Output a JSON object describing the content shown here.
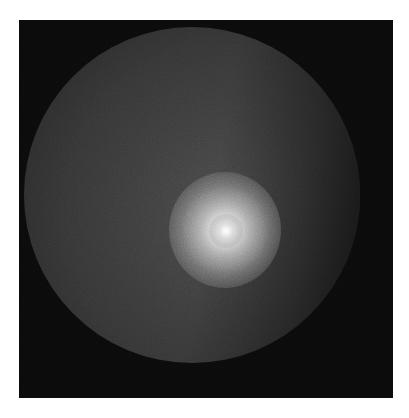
{
  "image": {
    "description": "Grayscale circular field with a bright diffuse spot offset right of center",
    "colors": {
      "page_background": "#ffffff",
      "frame_background": "#0b0b0b",
      "disc_fill": "#3a3a3a",
      "spot_peak": "#ffffff"
    },
    "frame": {
      "x": 19,
      "y": 20,
      "width": 374,
      "height": 378
    },
    "disc": {
      "center_x": 192,
      "center_y": 212,
      "radius": 168
    },
    "bright_spot": {
      "center_x": 225,
      "center_y": 230,
      "radius": 48
    }
  }
}
